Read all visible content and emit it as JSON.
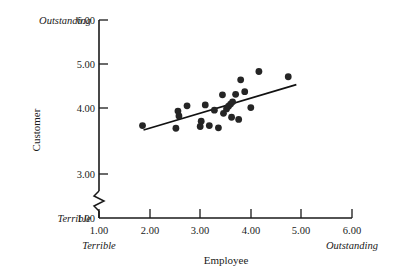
{
  "chart_data": {
    "type": "scatter",
    "title": "",
    "xlabel": "Employee",
    "ylabel": "Customer",
    "xlim": [
      1.0,
      6.0
    ],
    "ylim": [
      3.0,
      6.0
    ],
    "y_axis_break": true,
    "y_axis_break_note": "axis broken between 1.00 and 3.00",
    "grid": false,
    "legend": null,
    "xticks": [
      "1.00",
      "2.00",
      "3.00",
      "4.00",
      "5.00",
      "6.00"
    ],
    "xtick_values": [
      1.0,
      2.0,
      3.0,
      4.0,
      5.0,
      6.0
    ],
    "yticks": [
      "1.00",
      "3.00",
      "4.00",
      "5.00",
      "6.00"
    ],
    "ytick_values": [
      1.0,
      3.0,
      4.0,
      5.0,
      6.0
    ],
    "x_anchor_low": "Terrible",
    "x_anchor_high": "Outstanding",
    "y_anchor_low": "Terrible",
    "y_anchor_high": "Outstanding",
    "points": [
      {
        "x": 1.86,
        "y": 3.6
      },
      {
        "x": 2.52,
        "y": 3.54
      },
      {
        "x": 2.56,
        "y": 3.93
      },
      {
        "x": 2.58,
        "y": 3.82
      },
      {
        "x": 2.74,
        "y": 4.05
      },
      {
        "x": 3.0,
        "y": 3.58
      },
      {
        "x": 3.02,
        "y": 3.7
      },
      {
        "x": 3.1,
        "y": 4.07
      },
      {
        "x": 3.18,
        "y": 3.6
      },
      {
        "x": 3.28,
        "y": 3.95
      },
      {
        "x": 3.36,
        "y": 3.55
      },
      {
        "x": 3.44,
        "y": 4.3
      },
      {
        "x": 3.46,
        "y": 3.88
      },
      {
        "x": 3.52,
        "y": 3.98
      },
      {
        "x": 3.56,
        "y": 4.04
      },
      {
        "x": 3.6,
        "y": 4.09
      },
      {
        "x": 3.62,
        "y": 3.79
      },
      {
        "x": 3.64,
        "y": 4.14
      },
      {
        "x": 3.7,
        "y": 4.31
      },
      {
        "x": 3.76,
        "y": 3.74
      },
      {
        "x": 3.8,
        "y": 4.64
      },
      {
        "x": 3.88,
        "y": 4.37
      },
      {
        "x": 4.0,
        "y": 4.01
      },
      {
        "x": 4.16,
        "y": 4.83
      },
      {
        "x": 4.74,
        "y": 4.71
      }
    ],
    "trend_line": {
      "x_start": 1.88,
      "y_start": 3.5,
      "x_end": 4.9,
      "y_end": 4.53
    }
  }
}
